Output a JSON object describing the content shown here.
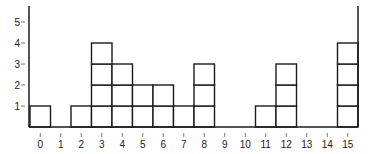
{
  "chart_data": {
    "type": "bar",
    "style": "stacked unit squares (dot-plot histogram)",
    "title": "",
    "xlabel": "",
    "ylabel": "",
    "categories": [
      "0",
      "1",
      "2",
      "3",
      "4",
      "5",
      "6",
      "7",
      "8",
      "9",
      "10",
      "11",
      "12",
      "13",
      "14",
      "15"
    ],
    "values": [
      1,
      0,
      1,
      4,
      3,
      2,
      2,
      1,
      3,
      0,
      0,
      1,
      3,
      0,
      0,
      4
    ],
    "y_ticks": [
      "1",
      "2",
      "3",
      "4",
      "5"
    ],
    "ylim": [
      0,
      5.5
    ],
    "grid": false,
    "legend": null
  },
  "colors": {
    "line": "#1a1a1a",
    "fill": "#ffffff",
    "text": "#222222"
  }
}
